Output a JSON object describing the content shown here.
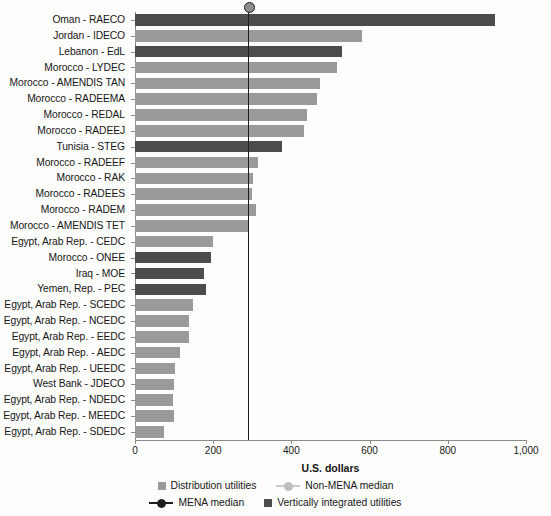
{
  "chart_data": {
    "type": "bar",
    "orientation": "horizontal",
    "title": "",
    "xlabel": "U.S. dollars",
    "ylabel": "",
    "xlim": [
      0,
      1000
    ],
    "xticks": [
      0,
      200,
      400,
      600,
      800,
      1000
    ],
    "xtick_labels": [
      "0",
      "200",
      "400",
      "600",
      "800",
      "1,000"
    ],
    "grid": false,
    "legend_position": "bottom",
    "categories": [
      "Oman - RAECO",
      "Jordan - IDECO",
      "Lebanon - EdL",
      "Morocco - LYDEC",
      "Morocco - AMENDIS TAN",
      "Morocco - RADEEMA",
      "Morocco - REDAL",
      "Morocco - RADEEJ",
      "Tunisia - STEG",
      "Morocco - RADEEF",
      "Morocco - RAK",
      "Morocco - RADEES",
      "Morocco - RADEM",
      "Morocco - AMENDIS TET",
      "Egypt, Arab Rep. - CEDC",
      "Morocco - ONEE",
      "Iraq - MOE",
      "Yemen, Rep. - PEC",
      "Egypt, Arab Rep. - SCEDC",
      "Egypt, Arab Rep. - NCEDC",
      "Egypt, Arab Rep. - EEDC",
      "Egypt, Arab Rep. - AEDC",
      "Egypt, Arab Rep. - UEEDC",
      "West Bank - JDECO",
      "Egypt, Arab Rep. - NDEDC",
      "Egypt, Arab Rep. - MEEDC",
      "Egypt, Arab Rep. - SDEDC"
    ],
    "values": [
      920,
      580,
      530,
      516,
      473,
      465,
      440,
      432,
      376,
      314,
      302,
      300,
      310,
      289,
      199,
      194,
      176,
      181,
      148,
      138,
      138,
      115,
      102,
      100,
      98,
      100,
      74
    ],
    "bar_types": [
      "vertically-integrated",
      "distribution",
      "vertically-integrated",
      "distribution",
      "distribution",
      "distribution",
      "distribution",
      "distribution",
      "vertically-integrated",
      "distribution",
      "distribution",
      "distribution",
      "distribution",
      "distribution",
      "distribution",
      "vertically-integrated",
      "vertically-integrated",
      "vertically-integrated",
      "distribution",
      "distribution",
      "distribution",
      "distribution",
      "distribution",
      "distribution",
      "distribution",
      "distribution",
      "distribution"
    ],
    "reference_lines": [
      {
        "name": "MENA median",
        "value": 289,
        "color": "#1d1d1d"
      }
    ],
    "legend": [
      {
        "label": "Distribution utilities",
        "marker": "square",
        "color": "#9a9a9a"
      },
      {
        "label": "Non-MENA median",
        "marker": "line-dot",
        "color": "#bdbdbd"
      },
      {
        "label": "MENA median",
        "marker": "line-dot",
        "color": "#1d1d1d"
      },
      {
        "label": "Vertically integrated utilities",
        "marker": "square",
        "color": "#4c4c4c"
      }
    ],
    "colors": {
      "distribution": "#9a9a9a",
      "vertically_integrated": "#4c4c4c",
      "mena_median": "#1d1d1d",
      "non_mena_median": "#bdbdbd",
      "axis": "#8b8b8b"
    }
  }
}
